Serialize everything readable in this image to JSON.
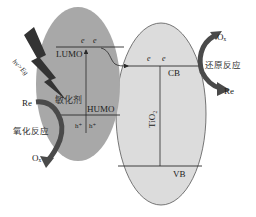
{
  "colors": {
    "sensitizer_fill": "#a8a8a8",
    "tio2_fill": "#dcdcdc",
    "line": "#2a2a2a",
    "arrow": "#444444",
    "bolt": "#333333"
  },
  "sensitizer": {
    "name": "敏化剂",
    "lumo": "LUMO",
    "humo": "HUMO",
    "electrons": [
      "e",
      "e"
    ],
    "holes": [
      "h⁺",
      "h⁺"
    ]
  },
  "tio2": {
    "name": "TiO₂",
    "cb": "CB",
    "vb": "VB",
    "electrons": [
      "e",
      "e"
    ]
  },
  "light": {
    "label": "hν>Eg"
  },
  "oxidation": {
    "reactant": "Re",
    "label": "氧化反应",
    "product": "Oₓ"
  },
  "reduction": {
    "reactant": "Oₓ",
    "label": "还原反应",
    "product": "Re"
  }
}
